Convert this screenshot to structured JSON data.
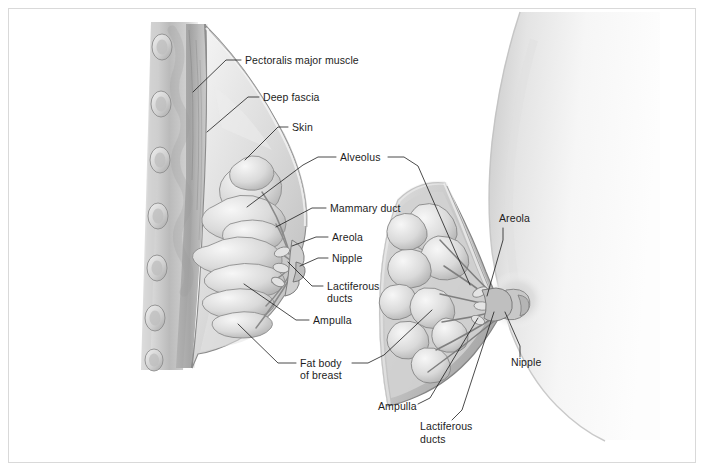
{
  "figure": {
    "border_color": "#d9d9d9",
    "background_color": "#ffffff",
    "ink_color": "#1d1d1d",
    "tissue_light": "#e9e9e9",
    "tissue_mid": "#c4c4c4",
    "tissue_dark": "#8e8e8e",
    "skin_tone": "#ededed"
  },
  "views": {
    "sagittal": {
      "name": "Sagittal (side) section of breast and chest wall",
      "rib_count": 7
    },
    "anterior": {
      "name": "Anterior wedge cut-away of breast on torso silhouette",
      "lobe_count": 8
    }
  },
  "labels": [
    {
      "id": "pectoralis-major-muscle",
      "text": "Pectoralis major muscle",
      "x": 245,
      "y": 64,
      "anchor": "start"
    },
    {
      "id": "deep-fascia",
      "text": "Deep fascia",
      "x": 263,
      "y": 101,
      "anchor": "start"
    },
    {
      "id": "skin",
      "text": "Skin",
      "x": 292,
      "y": 131,
      "anchor": "start"
    },
    {
      "id": "alveolus",
      "text": "Alveolus",
      "x": 340,
      "y": 161,
      "anchor": "start"
    },
    {
      "id": "mammary-duct",
      "text": "Mammary duct",
      "x": 330,
      "y": 212,
      "anchor": "start"
    },
    {
      "id": "areola-left",
      "text": "Areola",
      "x": 332,
      "y": 241,
      "anchor": "start"
    },
    {
      "id": "nipple-left",
      "text": "Nipple",
      "x": 332,
      "y": 262,
      "anchor": "start"
    },
    {
      "id": "lactiferous-ducts-left-1",
      "text": "Lactiferous",
      "x": 327,
      "y": 290,
      "anchor": "start"
    },
    {
      "id": "lactiferous-ducts-left-2",
      "text": "ducts",
      "x": 327,
      "y": 302,
      "anchor": "start"
    },
    {
      "id": "ampulla-left",
      "text": "Ampulla",
      "x": 313,
      "y": 324,
      "anchor": "start"
    },
    {
      "id": "fat-body-1",
      "text": "Fat body",
      "x": 300,
      "y": 367,
      "anchor": "start"
    },
    {
      "id": "fat-body-2",
      "text": "of breast",
      "x": 300,
      "y": 379,
      "anchor": "start"
    },
    {
      "id": "areola-right",
      "text": "Areola",
      "x": 499,
      "y": 222,
      "anchor": "start"
    },
    {
      "id": "nipple-right",
      "text": "Nipple",
      "x": 511,
      "y": 366,
      "anchor": "start"
    },
    {
      "id": "ampulla-right",
      "text": "Ampulla",
      "x": 378,
      "y": 410,
      "anchor": "start"
    },
    {
      "id": "lactiferous-ducts-right-1",
      "text": "Lactiferous",
      "x": 420,
      "y": 430,
      "anchor": "start"
    },
    {
      "id": "lactiferous-ducts-right-2",
      "text": "ducts",
      "x": 420,
      "y": 443,
      "anchor": "start"
    }
  ]
}
